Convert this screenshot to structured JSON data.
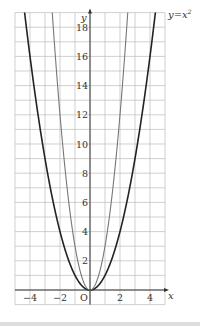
{
  "chart_data": {
    "type": "line",
    "title": "",
    "xlabel": "x",
    "ylabel": "y",
    "origin_label": "O",
    "xlim": [
      -5,
      5
    ],
    "ylim": [
      -1,
      19
    ],
    "grid": true,
    "x_ticks": [
      -4,
      -2,
      2,
      4
    ],
    "x_tick_labels": [
      "−4",
      "−2",
      "2",
      "4"
    ],
    "y_ticks": [
      2,
      4,
      6,
      8,
      10,
      12,
      14,
      16,
      18
    ],
    "y_tick_labels": [
      "2",
      "4",
      "6",
      "8",
      "10",
      "12",
      "14",
      "16",
      "18"
    ],
    "series": [
      {
        "name": "y=x²",
        "label_text": "y=x²",
        "function": "x^2",
        "coefficient": 1,
        "color": "#222222",
        "stroke_width": 1.6,
        "labeled": true
      },
      {
        "name": "y=3x²",
        "function": "3x^2",
        "coefficient": 3,
        "color": "#777777",
        "stroke_width": 1.1,
        "labeled": false
      }
    ],
    "curve_label": {
      "text_prefix": "y=x",
      "superscript": "2"
    }
  },
  "layout": {
    "origin_px": [
      90,
      290
    ],
    "unit_x_px": 15,
    "unit_y_px": 14.6,
    "grid_color": "#bbbbbb",
    "axis_color": "#333333"
  }
}
